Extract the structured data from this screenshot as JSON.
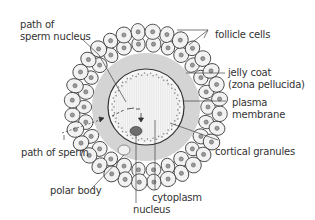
{
  "diagram": {
    "colors": {
      "background": "#ffffff",
      "line": "#333333",
      "jelly_coat": "#d4d4d4",
      "cell_fill": "#f2f2f2",
      "cell_nucleus": "#9a9a9a",
      "cytoplasm": "#f4f4f4",
      "egg_nucleus": "#6d6d6d"
    },
    "labels": {
      "path_of_sperm_nucleus_1": "path of",
      "path_of_sperm_nucleus_2": "sperm nucleus",
      "follicle_cells": "follicle cells",
      "jelly_coat_1": "jelly coat",
      "jelly_coat_2": "(zona pellucida)",
      "plasma_membrane_1": "plasma",
      "plasma_membrane_2": "membrane",
      "path_of_sperm": "path of sperm",
      "cortical_granules": "cortical granules",
      "polar_body": "polar body",
      "cytoplasm": "cytoplasm",
      "nucleus": "nucleus"
    }
  }
}
